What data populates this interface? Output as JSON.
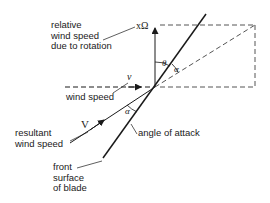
{
  "diagram": {
    "labels": {
      "relative_wind": [
        "relative",
        "wind speed",
        "due to rotation"
      ],
      "rotation_symbol": "xΩ",
      "wind_speed_symbol": "v",
      "wind_speed": "wind speed",
      "theta": "θ",
      "alpha_upper": "α",
      "alpha_lower": "α",
      "angle_of_attack": "angle of attack",
      "resultant_symbol": "V",
      "resultant": [
        "resultant",
        "wind speed"
      ],
      "front_surface": [
        "front",
        "surface",
        "of blade"
      ]
    },
    "colors": {
      "line": "#1a1a1a",
      "dashed": "#555555",
      "background": "#ffffff"
    }
  }
}
